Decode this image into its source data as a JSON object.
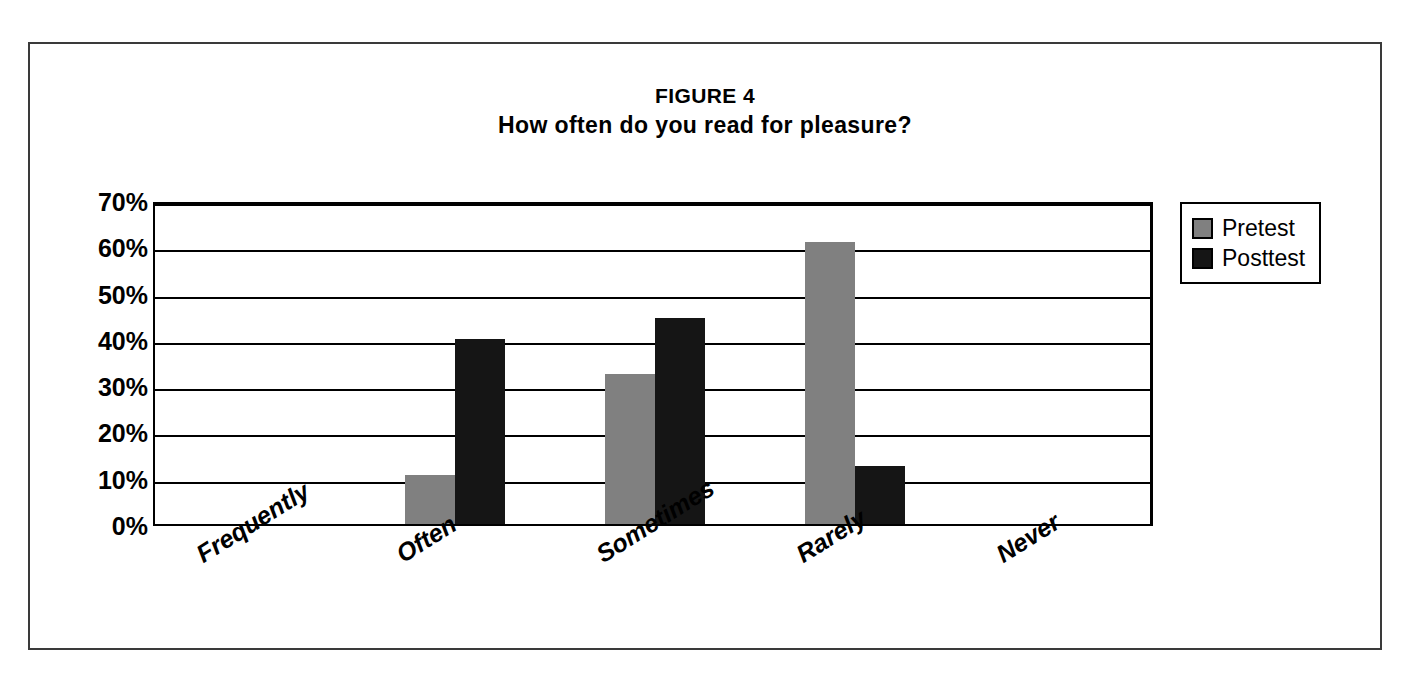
{
  "figure": {
    "title_main": "FIGURE 4",
    "title_sub": "How often do you read for pleasure?"
  },
  "legend": {
    "position": "right",
    "entries": [
      {
        "label": "Pretest",
        "color": "#808080",
        "swatch": "pretest-swatch"
      },
      {
        "label": "Posttest",
        "color": "#151515",
        "swatch": "posttest-swatch"
      }
    ]
  },
  "y_axis": {
    "ticks": [
      "70%",
      "60%",
      "50%",
      "40%",
      "30%",
      "20%",
      "10%",
      "0%"
    ]
  },
  "x_axis": {
    "ticks": [
      "Frequently",
      "Often",
      "Sometimes",
      "Rarely",
      "Never"
    ]
  },
  "chart_data": {
    "type": "bar",
    "xlabel": "",
    "ylabel": "",
    "ylim": [
      0,
      70
    ],
    "ytick_step": 10,
    "ytick_format": "percent",
    "grid": true,
    "legend_position": "right",
    "categories": [
      "Frequently",
      "Often",
      "Sometimes",
      "Rarely",
      "Never"
    ],
    "series": [
      {
        "name": "Pretest",
        "color": "#808080",
        "values": [
          0,
          10.5,
          32.5,
          61.0,
          0
        ]
      },
      {
        "name": "Posttest",
        "color": "#151515",
        "values": [
          0,
          40.0,
          44.5,
          12.5,
          0
        ]
      }
    ],
    "value_labels": false
  }
}
